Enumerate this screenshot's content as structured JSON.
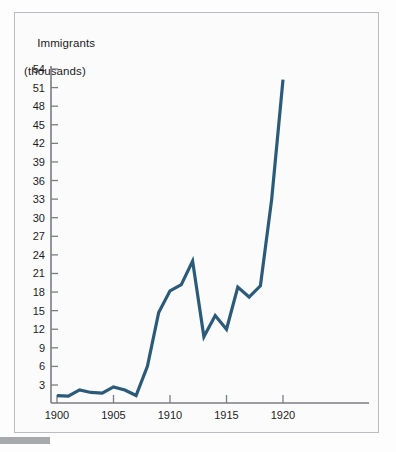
{
  "figure": {
    "background_color": "#fbfbfc",
    "border_color": "#b9bcc0"
  },
  "accent_color": "#2c5a79",
  "axis_color": "#7a7d81",
  "text_color": "#1b1b1b",
  "title": {
    "line1": "Immigrants",
    "line2": "(thousands)"
  },
  "chart_data": {
    "type": "line",
    "title": "Immigrants (thousands)",
    "xlabel": "",
    "ylabel": "Immigrants (thousands)",
    "x": [
      1900,
      1901,
      1902,
      1903,
      1904,
      1905,
      1906,
      1907,
      1908,
      1909,
      1910,
      1911,
      1912,
      1913,
      1914,
      1915,
      1916,
      1917,
      1918,
      1919,
      1920
    ],
    "values": [
      1.3,
      1.2,
      2.2,
      1.8,
      1.7,
      2.7,
      2.2,
      1.3,
      6.0,
      14.7,
      18.2,
      19.2,
      23.0,
      10.8,
      14.2,
      12.0,
      18.8,
      17.2,
      19.0,
      33.0,
      52.3
    ],
    "series": [
      {
        "name": "Immigrants",
        "color": "#2c5a79",
        "values": [
          1.3,
          1.2,
          2.2,
          1.8,
          1.7,
          2.7,
          2.2,
          1.3,
          6.0,
          14.7,
          18.2,
          19.2,
          23.0,
          10.8,
          14.2,
          12.0,
          18.8,
          17.2,
          19.0,
          33.0,
          52.3
        ]
      }
    ],
    "xlim": [
      1900,
      1924
    ],
    "ylim": [
      0,
      55.5
    ],
    "y_ticks": [
      3,
      6,
      9,
      12,
      15,
      18,
      21,
      24,
      27,
      30,
      33,
      36,
      39,
      42,
      45,
      48,
      51,
      54
    ],
    "y_tick_labels": [
      "3",
      "6",
      "9",
      "12",
      "15",
      "18",
      "21",
      "24",
      "27",
      "30",
      "33",
      "36",
      "39",
      "42",
      "45",
      "48",
      "51",
      "54"
    ],
    "x_ticks": [
      1900,
      1905,
      1910,
      1915,
      1920
    ],
    "x_tick_labels": [
      "1900",
      "1905",
      "1910",
      "1915",
      "1920"
    ],
    "grid": false,
    "legend": false
  }
}
